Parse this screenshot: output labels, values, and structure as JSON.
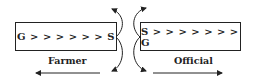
{
  "diagram": {
    "left_box": {
      "text": "G > > > > > > S",
      "label": "Farmer"
    },
    "right_box": {
      "text": "S > > > > > > > G",
      "label": "Official"
    },
    "arrows": [
      {
        "from": "left box right edge",
        "direction": "up-right curved"
      },
      {
        "from": "left box right edge",
        "direction": "down curved, pointing left"
      },
      {
        "from": "right box left edge",
        "direction": "up curved, pointing right"
      },
      {
        "from": "right box left edge",
        "direction": "down curved, pointing right"
      },
      {
        "type": "straight",
        "direction": "left",
        "position": "bottom-left"
      },
      {
        "type": "straight",
        "direction": "right",
        "position": "bottom-right"
      }
    ],
    "colors": {
      "stroke": "#222222",
      "background": "#ffffff"
    }
  }
}
